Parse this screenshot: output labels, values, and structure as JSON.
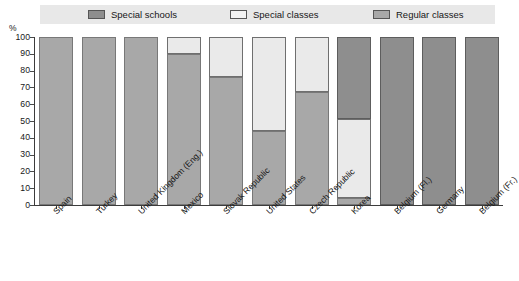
{
  "chart_data": {
    "type": "bar",
    "subtype": "stacked-bar-100",
    "title": "",
    "xlabel": "",
    "ylabel": "%",
    "ylim": [
      0,
      100
    ],
    "yticks": [
      0,
      10,
      20,
      30,
      40,
      50,
      60,
      70,
      80,
      90,
      100
    ],
    "grid": false,
    "legend_position": "top",
    "categories": [
      "Spain",
      "Turkey",
      "United Kingdom (Eng.)",
      "Mexico",
      "Slovak Republic",
      "United States",
      "Czech Republic",
      "Korea",
      "Belgium (Fl.)",
      "Germany",
      "Belgium (Fr.)"
    ],
    "series": [
      {
        "name": "Special schools",
        "color": "#8e8e8e",
        "values": [
          0,
          0,
          0,
          0,
          0,
          0,
          0,
          49,
          100,
          100,
          100
        ]
      },
      {
        "name": "Special classes",
        "color": "#eaeaea",
        "values": [
          0,
          0,
          0,
          10,
          24,
          56,
          33,
          47,
          0,
          0,
          0
        ]
      },
      {
        "name": "Regular classes",
        "color": "#a8a8a8",
        "values": [
          100,
          100,
          100,
          90,
          76,
          44,
          67,
          4,
          0,
          0,
          0
        ]
      }
    ]
  },
  "legend": {
    "items": [
      {
        "label": "Special schools",
        "swatch": "#8e8e8e"
      },
      {
        "label": "Special classes",
        "swatch": "#eaeaea"
      },
      {
        "label": "Regular classes",
        "swatch": "#a8a8a8"
      }
    ]
  },
  "axis": {
    "y_unit": "%",
    "y_ticks": [
      "100",
      "90",
      "80",
      "70",
      "60",
      "50",
      "40",
      "30",
      "20",
      "10",
      "0"
    ]
  }
}
